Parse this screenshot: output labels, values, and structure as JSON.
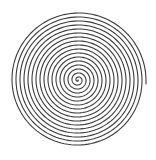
{
  "figure": {
    "type": "archimedean-spiral",
    "background": "#ffffff",
    "stroke_color": "#3a3a3a",
    "stroke_width": 1.1,
    "center": [
      78,
      80
    ],
    "outer_radius": 68,
    "turns": 17,
    "end_angle_deg": 0,
    "outer_tail": {
      "dx": 0,
      "dy": 4
    }
  }
}
